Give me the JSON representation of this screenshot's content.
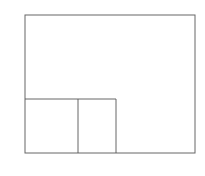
{
  "diagram": {
    "title": "",
    "axis_labels": {
      "y_top": "1",
      "y_bottom": "0",
      "y_p": "p"
    },
    "curves": [
      {
        "name": "F",
        "sub": "x",
        "center_x": 88,
        "scale": 13.5
      },
      {
        "name": "F",
        "sub": "y",
        "center_x": 126,
        "scale": 13.5
      }
    ],
    "quantiles": [
      {
        "name": "q",
        "sub": "x",
        "x": 78
      },
      {
        "name": "q",
        "sub": "y",
        "x": 116
      }
    ],
    "p_level_y": 99,
    "line_color": "#555555"
  }
}
